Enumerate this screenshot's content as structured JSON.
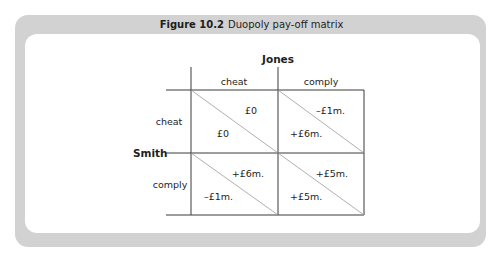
{
  "figure": {
    "number": "Figure 10.2",
    "caption": "Duopoly pay-off matrix"
  },
  "matrix": {
    "column_player": "Jones",
    "row_player": "Smith",
    "column_strategies": [
      "cheat",
      "comply"
    ],
    "row_strategies": [
      "cheat",
      "comply"
    ],
    "cells": [
      [
        {
          "jones_payoff": "£0",
          "smith_payoff": "£0"
        },
        {
          "jones_payoff": "–£1m.",
          "smith_payoff": "+£6m."
        }
      ],
      [
        {
          "jones_payoff": "+£6m.",
          "smith_payoff": "–£1m."
        },
        {
          "jones_payoff": "+£5m.",
          "smith_payoff": "+£5m."
        }
      ]
    ]
  },
  "colors": {
    "frame": "#d2d2d2",
    "text": "#1e1e1e",
    "grid": "#3a3a3a",
    "diagonal": "#9a9a9a"
  }
}
